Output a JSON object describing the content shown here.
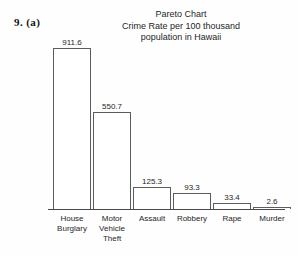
{
  "problem": {
    "label": "9.  (a)"
  },
  "title": {
    "line1": "Pareto Chart",
    "line2": "Crime Rate per 100 thousand",
    "line3": "population in Hawaii"
  },
  "colors": {
    "background": "#fefefe",
    "bar_outline": "#5c5c5c",
    "bar_fill": "#ffffff",
    "axis": "#4a4a4a",
    "text": "#262626"
  },
  "chart_data": {
    "type": "bar",
    "title": "Pareto Chart\nCrime Rate per 100 thousand population in Hawaii",
    "xlabel": "",
    "ylabel": "",
    "ylim": [
      0,
      911.6
    ],
    "grid": false,
    "legend": "none",
    "sorted_descending": true,
    "categories": [
      "House Burglary",
      "Motor Vehicle Theft",
      "Assault",
      "Robbery",
      "Rape",
      "Murder"
    ],
    "category_lines": [
      [
        "House",
        "Burglary"
      ],
      [
        "Motor",
        "Vehicle",
        "Theft"
      ],
      [
        "Assault"
      ],
      [
        "Robbery"
      ],
      [
        "Rape"
      ],
      [
        "Murder"
      ]
    ],
    "values": [
      911.6,
      550.7,
      125.3,
      93.3,
      33.4,
      2.6
    ],
    "value_labels": [
      "911.6",
      "550.7",
      "125.3",
      "93.3",
      "33.4",
      "2.6"
    ],
    "bars": [
      {
        "label": "House Burglary",
        "value": 911.6,
        "value_label": "911.6",
        "x": 53,
        "width": 38
      },
      {
        "label": "Motor Vehicle Theft",
        "value": 550.7,
        "value_label": "550.7",
        "x": 101,
        "width": 38
      },
      {
        "label": "Assault",
        "value": 125.3,
        "value_label": "125.3",
        "x": 149,
        "width": 38
      },
      {
        "label": "Robbery",
        "value": 93.3,
        "value_label": "93.3",
        "x": 197,
        "width": 38
      },
      {
        "label": "Rape",
        "value": 33.4,
        "value_label": "33.4",
        "x": 221,
        "width": 38
      },
      {
        "label": "Murder",
        "value": 2.6,
        "value_label": "2.6",
        "x": 245,
        "width": 38
      }
    ]
  }
}
